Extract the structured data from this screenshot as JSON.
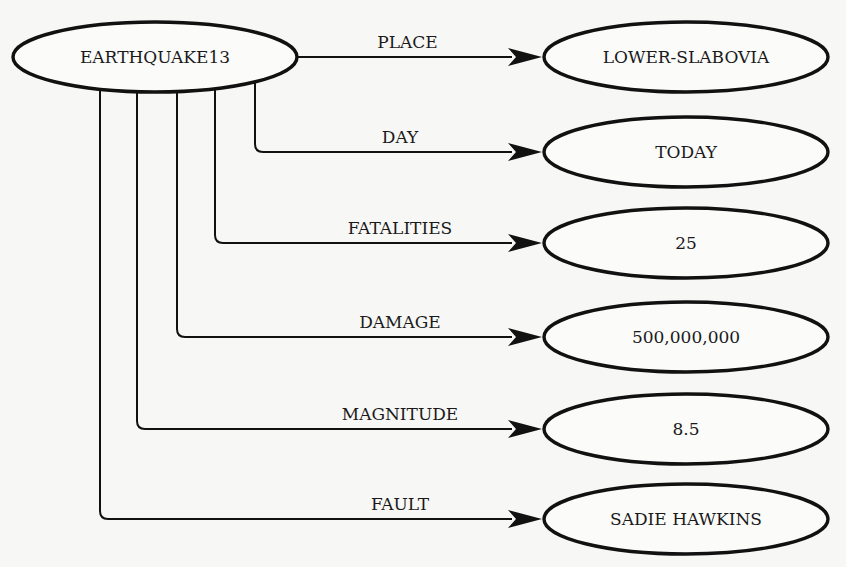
{
  "diagram": {
    "type": "semantic-network",
    "source": {
      "label": "EARTHQUAKE13",
      "cx": 155,
      "cy": 57,
      "rx": 142,
      "ry": 35
    },
    "targets": [
      {
        "relation": "PLACE",
        "value": "LOWER-SLABOVIA",
        "cy": 57,
        "drop_x": null
      },
      {
        "relation": "DAY",
        "value": "TODAY",
        "cy": 152,
        "drop_x": 255
      },
      {
        "relation": "FATALITIES",
        "value": "25",
        "cy": 243,
        "drop_x": 215
      },
      {
        "relation": "DAMAGE",
        "value": "500,000,000",
        "cy": 337,
        "drop_x": 177
      },
      {
        "relation": "MAGNITUDE",
        "value": "8.5",
        "cy": 429,
        "drop_x": 137
      },
      {
        "relation": "FAULT",
        "value": "SADIE HAWKINS",
        "cy": 519,
        "drop_x": 100
      }
    ],
    "target_ellipse": {
      "cx": 686,
      "rx": 142,
      "ry": 35
    },
    "arrow_tip_x": 542,
    "colors": {
      "line": "#111111",
      "background": "#f7f7f5"
    }
  }
}
